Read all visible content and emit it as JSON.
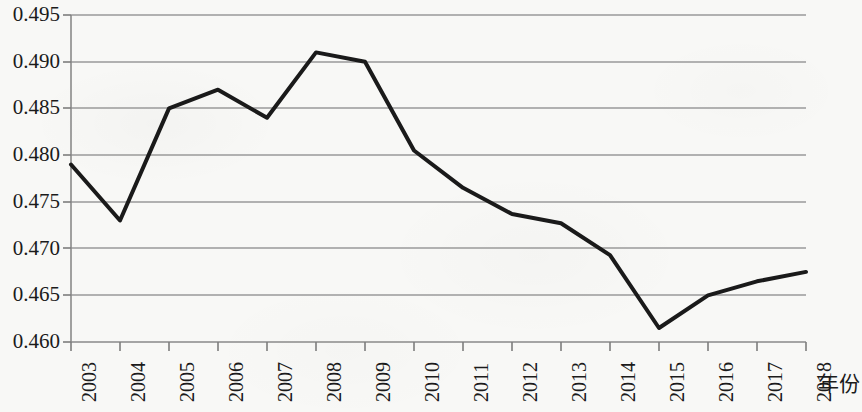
{
  "chart_data": {
    "type": "line",
    "title": "",
    "subtitle": "",
    "xlabel": "年份",
    "ylabel": "",
    "categories": [
      "2003",
      "2004",
      "2005",
      "2006",
      "2007",
      "2008",
      "2009",
      "2010",
      "2011",
      "2012",
      "2013",
      "2014",
      "2015",
      "2016",
      "2017",
      "2018"
    ],
    "values": [
      0.479,
      0.473,
      0.485,
      0.487,
      0.484,
      0.491,
      0.49,
      0.4805,
      0.4765,
      0.4737,
      0.4727,
      0.4693,
      0.4615,
      0.465,
      0.4665,
      0.4675
    ],
    "series": [
      {
        "name": "",
        "values": [
          0.479,
          0.473,
          0.485,
          0.487,
          0.484,
          0.491,
          0.49,
          0.4805,
          0.4765,
          0.4737,
          0.4727,
          0.4693,
          0.4615,
          0.465,
          0.4665,
          0.4675
        ]
      }
    ],
    "ylim": [
      0.46,
      0.495
    ],
    "xlim": [
      "2003",
      "2018"
    ],
    "ytick_labels": [
      "0.495",
      "0.490",
      "0.485",
      "0.480",
      "0.475",
      "0.470",
      "0.465",
      "0.460"
    ],
    "ytick_values": [
      0.495,
      0.49,
      0.485,
      0.48,
      0.475,
      0.47,
      0.465,
      0.46
    ],
    "grid": true,
    "grid_axis": "y",
    "legend": false,
    "legend_position": "none",
    "line_color": "#1a1a1a",
    "grid_color": "#9a9a9a",
    "axis_color": "#777777",
    "background_color": "#f8f8f6",
    "line_width": 4,
    "markers": false,
    "annotations": []
  },
  "axis": {
    "x_title": "年份"
  }
}
